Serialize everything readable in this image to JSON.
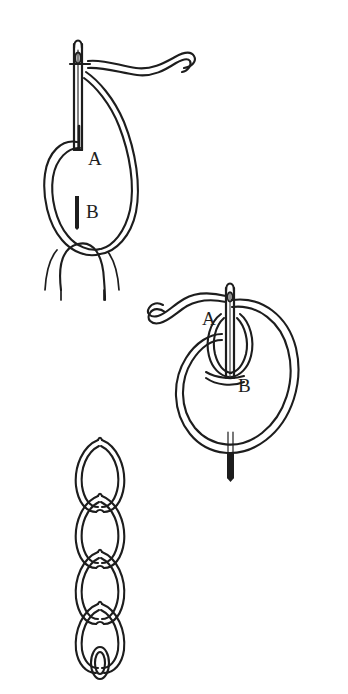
{
  "document": {
    "title": "Chain Stitch Embroidery Diagram",
    "medium": "pen-and-ink line drawing",
    "background_color": "#ffffff",
    "ink_color": "#1d1d1d",
    "width": 348,
    "height": 694
  },
  "figures": [
    {
      "id": "figure-1",
      "name": "needle-forming-first-loop",
      "caption": "Needle held vertically with thread loop held down by the thumb; points A and B marked",
      "labels": [
        {
          "id": "label-a-fig1",
          "text": "A",
          "x": 88,
          "y": 158,
          "meaning": "needle exit point at top of loop"
        },
        {
          "id": "label-b-fig1",
          "text": "B",
          "x": 86,
          "y": 211,
          "meaning": "needle re-entry point at bottom of loop"
        }
      ],
      "elements": [
        "sewing-needle",
        "needle-eye",
        "thread-tail",
        "thread-loop",
        "thumb",
        "tick-mark-a",
        "tick-mark-b"
      ]
    },
    {
      "id": "figure-2",
      "name": "needle-through-loop",
      "caption": "Needle passing through the previously formed loop to begin the next chain link; points A and B marked",
      "labels": [
        {
          "id": "label-a-fig2",
          "text": "A",
          "x": 208,
          "y": 318,
          "meaning": "top anchor of the working loop"
        },
        {
          "id": "label-b-fig2",
          "text": "B",
          "x": 242,
          "y": 384,
          "meaning": "base of the working loop where needle emerges"
        }
      ],
      "elements": [
        "sewing-needle",
        "needle-eye",
        "thread-tail",
        "large-thread-loop",
        "inner-thread-loop",
        "needle-point"
      ]
    },
    {
      "id": "figure-3",
      "name": "finished-chain-stitch",
      "caption": "Completed row of chain stitch showing four interlocking links and the final small loop",
      "labels": [],
      "link_count": 4,
      "elements": [
        "chain-link-1",
        "chain-link-2",
        "chain-link-3",
        "chain-link-4",
        "end-loop"
      ]
    }
  ],
  "legend": {
    "point_a": "A",
    "point_b": "B"
  }
}
